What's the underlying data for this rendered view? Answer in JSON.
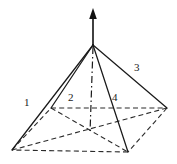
{
  "figure": {
    "kind": "geometry-diagram",
    "background_color": "#ffffff",
    "line_color": "#1a1a1a",
    "width": 177,
    "height": 164
  },
  "labels": {
    "edge_1": "1",
    "edge_2": "2",
    "edge_3": "3",
    "edge_4": "4"
  },
  "geometry": {
    "apex": {
      "x": 93,
      "y": 45
    },
    "axis_arrow_tip": {
      "x": 93,
      "y": 9
    },
    "axis_base": {
      "x": 90,
      "y": 133
    },
    "base_center": {
      "x": 90,
      "y": 130
    },
    "base_vertices": {
      "front_left": {
        "x": 12,
        "y": 150
      },
      "back_left": {
        "x": 51,
        "y": 108
      },
      "back_right": {
        "x": 167,
        "y": 108
      },
      "front_right": {
        "x": 128,
        "y": 152
      }
    }
  },
  "style": {
    "solid_edge_width": 1.25,
    "hidden_edge_dash": "5 3.2",
    "axis_dash": "7 3 1.5 3"
  }
}
